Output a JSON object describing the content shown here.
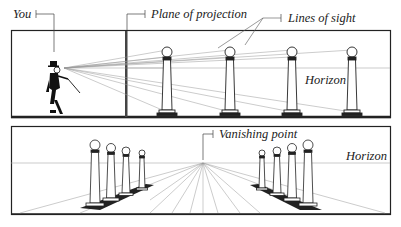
{
  "top_panel": {
    "labels": {
      "you": "You",
      "plane": "Plane of projection",
      "sight": "Lines of sight",
      "horizon": "Horizon"
    }
  },
  "bottom_panel": {
    "labels": {
      "vanishing": "Vanishing point",
      "horizon": "Horizon"
    }
  },
  "colors": {
    "line": "#222222",
    "thin": "#888888"
  }
}
